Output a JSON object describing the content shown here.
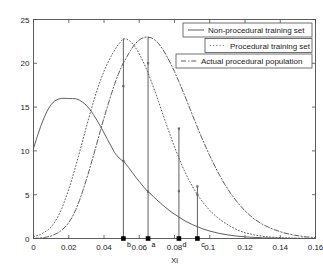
{
  "chart_data": {
    "type": "line",
    "title": "",
    "xlabel": "Xi",
    "ylabel": "",
    "xlim": [
      0,
      0.16
    ],
    "ylim": [
      0,
      25
    ],
    "xticks": [
      0,
      0.02,
      0.04,
      0.06,
      0.08,
      0.1,
      0.12,
      0.14,
      0.16
    ],
    "xticklabels": [
      "0",
      "0.02",
      "0.04",
      "0.06",
      "0.08",
      "0.1",
      "0.12",
      "0.14",
      "0.16"
    ],
    "yticks": [
      0,
      5,
      10,
      15,
      20,
      25
    ],
    "yticklabels": [
      "0",
      "5",
      "10",
      "15",
      "20",
      "25"
    ],
    "grid": false,
    "legend_position": "upper right",
    "series": [
      {
        "name": "Non-procedural training set",
        "style": "solid",
        "peak_x": 0.023,
        "peak_y": 16.0,
        "y_at_zero": 10.3,
        "points": [
          [
            0.0,
            10.3
          ],
          [
            0.002,
            11.55
          ],
          [
            0.004,
            12.75
          ],
          [
            0.006,
            13.8
          ],
          [
            0.008,
            14.65
          ],
          [
            0.01,
            15.3
          ],
          [
            0.012,
            15.7
          ],
          [
            0.014,
            15.92
          ],
          [
            0.016,
            16.0
          ],
          [
            0.018,
            16.0
          ],
          [
            0.02,
            15.98
          ],
          [
            0.022,
            15.97
          ],
          [
            0.023,
            15.97
          ],
          [
            0.024,
            15.95
          ],
          [
            0.026,
            15.8
          ],
          [
            0.028,
            15.55
          ],
          [
            0.03,
            15.2
          ],
          [
            0.032,
            14.72
          ],
          [
            0.034,
            14.15
          ],
          [
            0.036,
            13.5
          ],
          [
            0.038,
            12.8
          ],
          [
            0.04,
            12.05
          ],
          [
            0.042,
            11.3
          ],
          [
            0.044,
            10.55
          ],
          [
            0.046,
            9.8
          ],
          [
            0.048,
            9.3
          ],
          [
            0.05,
            8.95
          ],
          [
            0.051,
            8.85
          ],
          [
            0.054,
            8.1
          ],
          [
            0.056,
            7.55
          ],
          [
            0.058,
            7.0
          ],
          [
            0.06,
            6.5
          ],
          [
            0.062,
            6.0
          ],
          [
            0.064,
            5.55
          ],
          [
            0.065,
            5.35
          ],
          [
            0.068,
            4.8
          ],
          [
            0.07,
            4.4
          ],
          [
            0.074,
            3.7
          ],
          [
            0.078,
            3.05
          ],
          [
            0.0825,
            2.45
          ],
          [
            0.086,
            2.0
          ],
          [
            0.09,
            1.6
          ],
          [
            0.093,
            1.35
          ],
          [
            0.096,
            1.1
          ],
          [
            0.1,
            0.85
          ],
          [
            0.105,
            0.6
          ],
          [
            0.11,
            0.42
          ],
          [
            0.115,
            0.28
          ],
          [
            0.12,
            0.18
          ],
          [
            0.13,
            0.08
          ],
          [
            0.14,
            0.03
          ],
          [
            0.15,
            0.01
          ],
          [
            0.16,
            0.0
          ]
        ]
      },
      {
        "name": "Procedural training set",
        "style": "dotted",
        "peak_x": 0.051,
        "peak_y": 22.8,
        "y_at_zero": 0.2,
        "points": [
          [
            0.0,
            0.2
          ],
          [
            0.004,
            0.45
          ],
          [
            0.008,
            0.95
          ],
          [
            0.01,
            1.3
          ],
          [
            0.012,
            1.85
          ],
          [
            0.014,
            2.55
          ],
          [
            0.016,
            3.4
          ],
          [
            0.018,
            4.45
          ],
          [
            0.02,
            5.6
          ],
          [
            0.022,
            6.9
          ],
          [
            0.024,
            8.3
          ],
          [
            0.026,
            9.75
          ],
          [
            0.028,
            11.25
          ],
          [
            0.03,
            12.75
          ],
          [
            0.032,
            14.2
          ],
          [
            0.034,
            15.6
          ],
          [
            0.036,
            16.9
          ],
          [
            0.038,
            18.05
          ],
          [
            0.04,
            19.1
          ],
          [
            0.042,
            20.0
          ],
          [
            0.044,
            20.8
          ],
          [
            0.046,
            21.5
          ],
          [
            0.048,
            22.1
          ],
          [
            0.05,
            22.6
          ],
          [
            0.051,
            22.8
          ],
          [
            0.053,
            22.75
          ],
          [
            0.055,
            22.5
          ],
          [
            0.057,
            22.05
          ],
          [
            0.059,
            21.45
          ],
          [
            0.061,
            20.7
          ],
          [
            0.063,
            19.85
          ],
          [
            0.065,
            18.9
          ],
          [
            0.067,
            17.85
          ],
          [
            0.069,
            16.75
          ],
          [
            0.071,
            15.6
          ],
          [
            0.073,
            14.4
          ],
          [
            0.075,
            13.25
          ],
          [
            0.078,
            11.55
          ],
          [
            0.08,
            10.45
          ],
          [
            0.0825,
            9.2
          ],
          [
            0.085,
            8.0
          ],
          [
            0.088,
            6.75
          ],
          [
            0.09,
            6.0
          ],
          [
            0.093,
            5.0
          ],
          [
            0.096,
            4.15
          ],
          [
            0.1,
            3.2
          ],
          [
            0.104,
            2.45
          ],
          [
            0.108,
            1.85
          ],
          [
            0.112,
            1.35
          ],
          [
            0.116,
            0.95
          ],
          [
            0.12,
            0.65
          ],
          [
            0.126,
            0.38
          ],
          [
            0.132,
            0.2
          ],
          [
            0.14,
            0.09
          ],
          [
            0.15,
            0.03
          ],
          [
            0.16,
            0.01
          ]
        ]
      },
      {
        "name": "Actual procedural population",
        "style": "dashdot",
        "peak_x": 0.065,
        "peak_y": 23.0,
        "y_at_zero": 0.0,
        "points": [
          [
            0.0,
            0.0
          ],
          [
            0.006,
            0.1
          ],
          [
            0.01,
            0.28
          ],
          [
            0.014,
            0.65
          ],
          [
            0.018,
            1.3
          ],
          [
            0.02,
            1.8
          ],
          [
            0.022,
            2.45
          ],
          [
            0.024,
            3.3
          ],
          [
            0.026,
            4.3
          ],
          [
            0.028,
            5.45
          ],
          [
            0.03,
            6.7
          ],
          [
            0.032,
            8.05
          ],
          [
            0.034,
            9.45
          ],
          [
            0.036,
            10.9
          ],
          [
            0.038,
            12.35
          ],
          [
            0.04,
            13.75
          ],
          [
            0.042,
            15.1
          ],
          [
            0.044,
            16.4
          ],
          [
            0.046,
            17.6
          ],
          [
            0.048,
            18.7
          ],
          [
            0.05,
            19.65
          ],
          [
            0.051,
            20.05
          ],
          [
            0.053,
            20.75
          ],
          [
            0.055,
            21.45
          ],
          [
            0.057,
            22.05
          ],
          [
            0.059,
            22.5
          ],
          [
            0.061,
            22.8
          ],
          [
            0.063,
            22.97
          ],
          [
            0.065,
            23.0
          ],
          [
            0.067,
            22.9
          ],
          [
            0.069,
            22.65
          ],
          [
            0.071,
            22.25
          ],
          [
            0.073,
            21.7
          ],
          [
            0.075,
            21.05
          ],
          [
            0.078,
            19.9
          ],
          [
            0.08,
            19.05
          ],
          [
            0.0825,
            17.9
          ],
          [
            0.085,
            16.7
          ],
          [
            0.088,
            15.2
          ],
          [
            0.09,
            14.2
          ],
          [
            0.093,
            12.7
          ],
          [
            0.096,
            11.25
          ],
          [
            0.1,
            9.45
          ],
          [
            0.104,
            7.8
          ],
          [
            0.108,
            6.35
          ],
          [
            0.112,
            5.1
          ],
          [
            0.116,
            4.05
          ],
          [
            0.12,
            3.15
          ],
          [
            0.125,
            2.25
          ],
          [
            0.13,
            1.6
          ],
          [
            0.136,
            1.05
          ],
          [
            0.142,
            0.65
          ],
          [
            0.148,
            0.38
          ],
          [
            0.154,
            0.2
          ],
          [
            0.16,
            0.1
          ]
        ]
      }
    ],
    "stems": [
      {
        "label": "b",
        "x": 0.051,
        "y": 22.8,
        "marker": "square"
      },
      {
        "label": "a",
        "x": 0.065,
        "y": 23.0,
        "marker": "square"
      },
      {
        "label": "d",
        "x": 0.0825,
        "y": 12.55,
        "marker": "square"
      },
      {
        "label": "c",
        "x": 0.093,
        "y": 5.95,
        "marker": "square"
      }
    ],
    "stem_points": [
      {
        "x": 0.051,
        "y": 17.4
      },
      {
        "x": 0.051,
        "y": 8.85
      },
      {
        "x": 0.065,
        "y": 20.0
      },
      {
        "x": 0.065,
        "y": 5.35
      },
      {
        "x": 0.0825,
        "y": 12.55
      },
      {
        "x": 0.0825,
        "y": 5.4
      },
      {
        "x": 0.093,
        "y": 5.95
      },
      {
        "x": 0.093,
        "y": 5.0
      }
    ],
    "legend": [
      {
        "label": "Non-procedural training set",
        "style": "solid"
      },
      {
        "label": "Procedural training set",
        "style": "dotted"
      },
      {
        "label": "Actual procedural population",
        "style": "dashdot"
      }
    ],
    "colors": {
      "axis": "#4d4d4d",
      "text": "#1a1a1a",
      "curve": "#555555",
      "stem": "#4d4d4d",
      "marker": "#000000",
      "background": "#ffffff"
    }
  }
}
